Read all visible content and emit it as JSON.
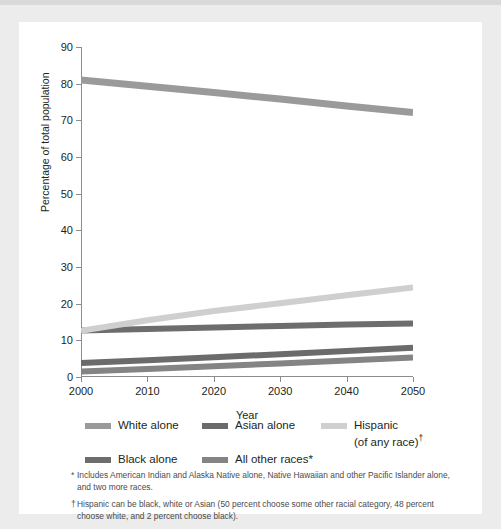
{
  "chart_data": {
    "type": "line",
    "title": "",
    "xlabel": "Year",
    "ylabel": "Percentage of total population",
    "xlim": [
      2000,
      2050
    ],
    "ylim": [
      0,
      90
    ],
    "xticks": [
      2000,
      2010,
      2020,
      2030,
      2040,
      2050
    ],
    "yticks": [
      0,
      10,
      20,
      30,
      40,
      50,
      60,
      70,
      80,
      90
    ],
    "grid": false,
    "legend_position": "below",
    "x": [
      2000,
      2010,
      2020,
      2030,
      2040,
      2050
    ],
    "series": [
      {
        "name": "White alone",
        "color": "#9a9a9a",
        "values": [
          81.0,
          79.3,
          77.6,
          75.8,
          73.9,
          72.1
        ]
      },
      {
        "name": "Black alone",
        "color": "#6d6d6d",
        "values": [
          12.7,
          13.1,
          13.5,
          13.9,
          14.3,
          14.6
        ]
      },
      {
        "name": "Asian alone",
        "color": "#6b6b6b",
        "values": [
          3.8,
          4.6,
          5.4,
          6.2,
          7.1,
          8.0
        ]
      },
      {
        "name": "All other races*",
        "color": "#848484",
        "values": [
          1.5,
          2.2,
          2.9,
          3.7,
          4.5,
          5.3
        ]
      },
      {
        "name": "Hispanic (of any race)",
        "color": "#cfcfcf",
        "values": [
          12.6,
          15.5,
          18.0,
          20.1,
          22.3,
          24.4
        ]
      }
    ]
  },
  "axis": {
    "y_title": "Percentage of total population",
    "x_title": "Year",
    "y_tick_labels": [
      "0",
      "10",
      "20",
      "30",
      "40",
      "50",
      "60",
      "70",
      "80",
      "90"
    ],
    "x_tick_labels": [
      "2000",
      "2010",
      "2020",
      "2030",
      "2040",
      "2050"
    ]
  },
  "legend": {
    "items": [
      {
        "label": "White alone",
        "color": "#9a9a9a",
        "marker": ""
      },
      {
        "label": "Asian alone",
        "color": "#6b6b6b",
        "marker": ""
      },
      {
        "label": "Hispanic",
        "label2": "(of any race)",
        "color": "#cfcfcf",
        "marker": "†"
      },
      {
        "label": "Black alone",
        "color": "#6d6d6d",
        "marker": ""
      },
      {
        "label": "All other races",
        "color": "#848484",
        "marker": "*"
      }
    ]
  },
  "footnotes": [
    {
      "marker": "*",
      "text": "Includes American Indian and Alaska Native alone, Native Hawaiian and other Pacific Islander alone, and two more races."
    },
    {
      "marker": "†",
      "text": "Hispanic can be black, white or Asian (50 percent choose some other racial category, 48 percent choose white, and 2 percent choose black)."
    }
  ]
}
